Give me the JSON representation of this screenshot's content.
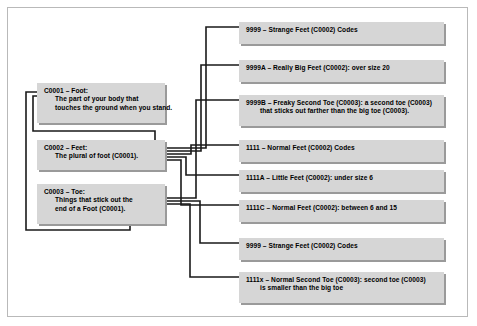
{
  "figure": {
    "background_color": "#ffffff",
    "frame_color": "#b9b9b9",
    "node_fill": "#d6d6d6",
    "node_shadow": "#9a9a9a",
    "connector_color": "#1a1a1a"
  },
  "definitions": [
    {
      "id": "C0001",
      "heading": "C0001 – Foot:",
      "lines": [
        "The part of your body that",
        "touches the ground when you stand."
      ]
    },
    {
      "id": "C0002",
      "heading": "C0002 – Feet:",
      "lines": [
        "The plural of foot (C0001)."
      ]
    },
    {
      "id": "C0003",
      "heading": "C0003 – Toe:",
      "lines": [
        "Things that stick out the",
        "end of a Foot (C0001)."
      ]
    }
  ],
  "codes": [
    {
      "id": "9999-top",
      "lines": [
        "9999 – Strange Feet (C0002) Codes"
      ]
    },
    {
      "id": "9999A",
      "lines": [
        "9999A – Really Big Feet (C0002): over size 20"
      ]
    },
    {
      "id": "9999B",
      "lines": [
        "9999B – Freaky Second Toe (C0003): a second toe (C0003)",
        "that sticks out farther than the big toe (C0003)."
      ]
    },
    {
      "id": "1111",
      "lines": [
        "1111 – Normal Feet (C0002) Codes"
      ]
    },
    {
      "id": "1111A",
      "lines": [
        "1111A – Little Feet (C0002): under size 6"
      ]
    },
    {
      "id": "1111C",
      "lines": [
        "1111C – Normal Feet (C0002): between 6 and 15"
      ]
    },
    {
      "id": "9999-bottom",
      "lines": [
        "9999 – Strange Feet (C0002) Codes"
      ]
    },
    {
      "id": "1111x",
      "lines": [
        "1111x – Normal Second Toe (C0003): second toe (C0003)",
        "is smaller than the big toe"
      ]
    }
  ]
}
